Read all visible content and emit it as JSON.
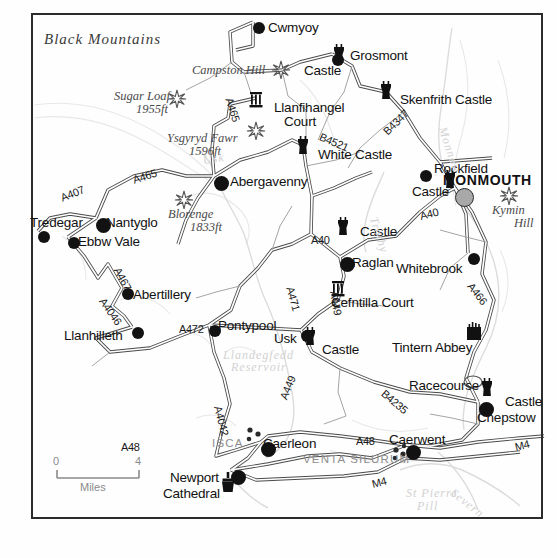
{
  "map": {
    "title_region": "Black      Mountains",
    "scale": {
      "left": "0",
      "right": "4",
      "unit": "Miles"
    },
    "colors": {
      "ink": "#121212",
      "frame": "#2b2b2b",
      "road_fill": "#ffffff",
      "road_stroke": "#4a4a4a",
      "major_town_fill": "#a8a8a8",
      "water": "#d2d2d2",
      "roman_label": "#8d8d8d",
      "relief": "#e2e2e2"
    },
    "regions": [
      {
        "name": "Black      Mountains",
        "x": 44,
        "y": 31,
        "style": "region"
      }
    ],
    "hills": [
      {
        "name": "Campston Hill",
        "elev": "",
        "x": 192,
        "y": 63,
        "star_x": 281,
        "star_y": 70
      },
      {
        "name": "Sugar Loaf",
        "elev": "1955ft",
        "x": 114,
        "y": 89,
        "star_x": 175,
        "star_y": 99
      },
      {
        "name": "Ysgyryd Fawr",
        "elev": "1596ft",
        "x": 167,
        "y": 131,
        "star_x": 254,
        "star_y": 131
      },
      {
        "name": "Blorenge",
        "elev": "1833ft",
        "x": 168,
        "y": 207,
        "star_x": 183,
        "star_y": 199
      },
      {
        "name": "Kymin",
        "elev": "Hill",
        "x": 492,
        "y": 203,
        "star_x": 508,
        "star_y": 196
      }
    ],
    "towns": [
      {
        "name": "Cwmyoy",
        "label_x": 268,
        "label_y": 20,
        "dot_x": 253,
        "dot_y": 22,
        "size": "dot"
      },
      {
        "name": "Grosmont",
        "label_x": 350,
        "label_y": 48,
        "dot_x": 332,
        "dot_y": 54,
        "size": "dot"
      },
      {
        "name": "Llanfihangel",
        "label_x": 274,
        "label_y": 100,
        "dot_x": -1,
        "dot_y": -1,
        "size": "none"
      },
      {
        "name": "Court",
        "label_x": 284,
        "label_y": 114,
        "dot_x": -1,
        "dot_y": -1,
        "size": "none"
      },
      {
        "name": "Skenfrith Castle",
        "label_x": 400,
        "label_y": 92,
        "dot_x": -1,
        "dot_y": -1,
        "size": "none"
      },
      {
        "name": "White Castle",
        "label_x": 318,
        "label_y": 147,
        "dot_x": -1,
        "dot_y": -1,
        "size": "none"
      },
      {
        "name": "Rockfield",
        "label_x": 434,
        "label_y": 161,
        "dot_x": 420,
        "dot_y": 170,
        "size": "dot"
      },
      {
        "name": "MONMOUTH",
        "label_x": 443,
        "label_y": 172,
        "dot_x": 455,
        "dot_y": 188,
        "size": "graydot"
      },
      {
        "name": "Abergavenny",
        "label_x": 230,
        "label_y": 174,
        "dot_x": 214,
        "dot_y": 176,
        "size": "bigdot"
      },
      {
        "name": "Tredegar",
        "label_x": 30,
        "label_y": 215,
        "dot_x": 38,
        "dot_y": 231,
        "size": "dot"
      },
      {
        "name": "Nantyglo",
        "label_x": 106,
        "label_y": 215,
        "dot_x": 96,
        "dot_y": 218,
        "size": "bigdot"
      },
      {
        "name": "Ebbw Vale",
        "label_x": 78,
        "label_y": 234,
        "dot_x": 68,
        "dot_y": 237,
        "size": "dot"
      },
      {
        "name": "Abertillery",
        "label_x": 133,
        "label_y": 287,
        "dot_x": 122,
        "dot_y": 288,
        "size": "dot"
      },
      {
        "name": "Llanhilleth",
        "label_x": 64,
        "label_y": 328,
        "dot_x": 132,
        "dot_y": 327,
        "size": "dot"
      },
      {
        "name": "Pontypool",
        "label_x": 218,
        "label_y": 318,
        "dot_x": 209,
        "dot_y": 325,
        "size": "dot"
      },
      {
        "name": "Usk",
        "label_x": 274,
        "label_y": 331,
        "dot_x": 301,
        "dot_y": 330,
        "size": "dot"
      },
      {
        "name": "Raglan",
        "label_x": 352,
        "label_y": 255,
        "dot_x": 340,
        "dot_y": 257,
        "size": "bigdot"
      },
      {
        "name": "Whitebrook",
        "label_x": 396,
        "label_y": 261,
        "dot_x": 468,
        "dot_y": 253,
        "size": "dot"
      },
      {
        "name": "Cefntilla Court",
        "label_x": 331,
        "label_y": 295,
        "dot_x": -1,
        "dot_y": -1,
        "size": "none"
      },
      {
        "name": "Tintern Abbey",
        "label_x": 392,
        "label_y": 340,
        "dot_x": -1,
        "dot_y": -1,
        "size": "none"
      },
      {
        "name": "Racecourse",
        "label_x": 409,
        "label_y": 378,
        "dot_x": -1,
        "dot_y": -1,
        "size": "none"
      },
      {
        "name": "Chepstow",
        "label_x": 477,
        "label_y": 410,
        "dot_x": 479,
        "dot_y": 402,
        "size": "bigdot"
      },
      {
        "name": "Caerwent",
        "label_x": 389,
        "label_y": 432,
        "dot_x": 406,
        "dot_y": 445,
        "size": "bigdot"
      },
      {
        "name": "Caerleon",
        "label_x": 263,
        "label_y": 436,
        "dot_x": 261,
        "dot_y": 442,
        "size": "bigdot"
      },
      {
        "name": "Newport",
        "label_x": 170,
        "label_y": 470,
        "dot_x": 231,
        "dot_y": 470,
        "size": "bigdot"
      },
      {
        "name": "Cathedral",
        "label_x": 163,
        "label_y": 486,
        "dot_x": -1,
        "dot_y": -1,
        "size": "none"
      }
    ],
    "castle_labels": [
      {
        "name": "Castle",
        "x": 304,
        "y": 63
      },
      {
        "name": "Castle",
        "x": 412,
        "y": 184
      },
      {
        "name": "Castle",
        "x": 360,
        "y": 224
      },
      {
        "name": "Castle",
        "x": 322,
        "y": 342
      },
      {
        "name": "Castle",
        "x": 505,
        "y": 394
      }
    ],
    "castle_icons": [
      {
        "x": 339,
        "y": 53,
        "type": "tower"
      },
      {
        "x": 386,
        "y": 90,
        "type": "tower"
      },
      {
        "x": 303,
        "y": 145,
        "type": "tower"
      },
      {
        "x": 450,
        "y": 179,
        "type": "tower"
      },
      {
        "x": 343,
        "y": 226,
        "type": "tower"
      },
      {
        "x": 310,
        "y": 336,
        "type": "tower"
      },
      {
        "x": 487,
        "y": 387,
        "type": "tower"
      },
      {
        "x": 474,
        "y": 330,
        "type": "abbey"
      },
      {
        "x": 256,
        "y": 98,
        "type": "hall"
      },
      {
        "x": 338,
        "y": 287,
        "type": "hall"
      },
      {
        "x": 228,
        "y": 482,
        "type": "cathedral"
      }
    ],
    "roman_sites": [
      {
        "name": "ISCA",
        "x": 212,
        "y": 437,
        "dots_x": 250,
        "dots_y": 432
      },
      {
        "name": "VENTA SILURUM",
        "x": 303,
        "y": 453,
        "dots_x": 398,
        "dots_y": 453
      }
    ],
    "roads": [
      {
        "num": "A465",
        "x": 229,
        "y": 92,
        "rot": 72
      },
      {
        "num": "B4521",
        "x": 320,
        "y": 130,
        "rot": 23
      },
      {
        "num": "B4347",
        "x": 385,
        "y": 127,
        "rot": -45
      },
      {
        "num": "A465",
        "x": 133,
        "y": 174,
        "rot": -18
      },
      {
        "num": "A407",
        "x": 61,
        "y": 192,
        "rot": -22
      },
      {
        "num": "A467",
        "x": 117,
        "y": 262,
        "rot": 62
      },
      {
        "num": "A4046",
        "x": 102,
        "y": 293,
        "rot": 55
      },
      {
        "num": "A472",
        "x": 179,
        "y": 323,
        "rot": 0
      },
      {
        "num": "A40",
        "x": 311,
        "y": 234,
        "rot": 0
      },
      {
        "num": "A40",
        "x": 420,
        "y": 210,
        "rot": -14
      },
      {
        "num": "A471",
        "x": 290,
        "y": 281,
        "rot": 74
      },
      {
        "num": "A449",
        "x": 334,
        "y": 285,
        "rot": 80
      },
      {
        "num": "A466",
        "x": 470,
        "y": 278,
        "rot": 52
      },
      {
        "num": "B4235",
        "x": 383,
        "y": 386,
        "rot": 40
      },
      {
        "num": "A4042",
        "x": 218,
        "y": 400,
        "rot": 76
      },
      {
        "num": "A449",
        "x": 283,
        "y": 393,
        "rot": -68
      },
      {
        "num": "A48",
        "x": 356,
        "y": 435,
        "rot": 0
      },
      {
        "num": "M4",
        "x": 515,
        "y": 441,
        "rot": -14
      },
      {
        "num": "M4",
        "x": 372,
        "y": 478,
        "rot": -14
      },
      {
        "num": "A48",
        "x": 121,
        "y": 441,
        "rot": 0
      }
    ],
    "water_labels": [
      {
        "name": "Monnow",
        "x": 442,
        "y": 120,
        "rot": 72
      },
      {
        "name": "Trothy",
        "x": 373,
        "y": 210,
        "rot": 72
      },
      {
        "name": "Llandegfedd",
        "x": 223,
        "y": 348,
        "rot": 0
      },
      {
        "name": "Reservoir",
        "x": 231,
        "y": 360,
        "rot": 0
      },
      {
        "name": "St Pierre",
        "x": 406,
        "y": 486,
        "rot": 0
      },
      {
        "name": "Pill",
        "x": 417,
        "y": 499,
        "rot": 0
      },
      {
        "name": "Severn",
        "x": 452,
        "y": 484,
        "rot": 38
      },
      {
        "name": "Usk",
        "x": 203,
        "y": 153,
        "rot": -8
      }
    ]
  }
}
